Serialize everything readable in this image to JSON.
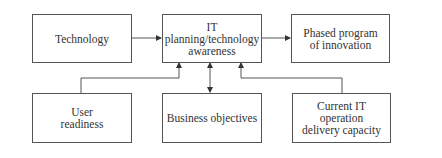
{
  "diagram": {
    "nodes": {
      "technology": {
        "label": "Technology"
      },
      "it_planning": {
        "label": "IT\nplanning/technology\nawareness"
      },
      "phased_program": {
        "label": "Phased program\nof innovation"
      },
      "user_readiness": {
        "label": "User\nreadiness"
      },
      "business_objectives": {
        "label": "Business objectives"
      },
      "current_it": {
        "label": "Current IT\noperation\ndelivery capacity"
      }
    },
    "edges": [
      {
        "from": "technology",
        "to": "it_planning",
        "type": "arrow"
      },
      {
        "from": "it_planning",
        "to": "phased_program",
        "type": "arrow"
      },
      {
        "from": "user_readiness",
        "to": "it_planning",
        "type": "elbow-arrow"
      },
      {
        "from": "business_objectives",
        "to": "it_planning",
        "type": "double-arrow"
      },
      {
        "from": "current_it",
        "to": "it_planning",
        "type": "elbow-arrow"
      }
    ],
    "colors": {
      "stroke": "#555555",
      "text": "#333333",
      "background": "#ffffff"
    }
  }
}
